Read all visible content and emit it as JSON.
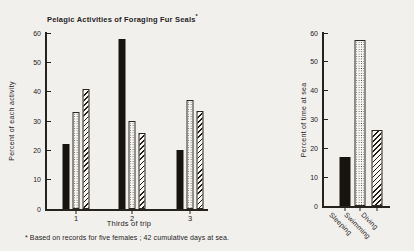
{
  "figure": {
    "title": "Pelagic Activities of Foraging Fur Seals",
    "title_mark": "*",
    "footnote": "* Based on records for five females ; 42 cumulative days at sea."
  },
  "colors": {
    "background": "#f2f0ec",
    "ink": "#26231f",
    "bar_solid": "#17140f",
    "pattern_bg": "#f8f7f4"
  },
  "chart_data": [
    {
      "type": "bar",
      "panel": "left",
      "title": "",
      "ylabel": "Percent of each activity",
      "xlabel": "Thirds of trip",
      "ylim": [
        0,
        60
      ],
      "yticks": [
        0,
        10,
        20,
        30,
        40,
        50,
        60
      ],
      "categories": [
        "1",
        "2",
        "3"
      ],
      "series": [
        {
          "name": "Sleeping",
          "pattern": "solid",
          "values": [
            22,
            58,
            20
          ]
        },
        {
          "name": "Swimming",
          "pattern": "stipple",
          "values": [
            33,
            30,
            37
          ]
        },
        {
          "name": "Diving",
          "pattern": "hatch",
          "values": [
            41,
            26,
            33.5
          ]
        }
      ],
      "grid": false,
      "legend": "none"
    },
    {
      "type": "bar",
      "panel": "right",
      "title": "",
      "ylabel": "Percent of time at sea",
      "xlabel": "",
      "ylim": [
        0,
        60
      ],
      "yticks": [
        0,
        10,
        20,
        30,
        40,
        50,
        60
      ],
      "categories": [
        "Sleeping",
        "Swimming",
        "Diving"
      ],
      "values": [
        17,
        57.5,
        26.5
      ],
      "patterns": [
        "solid",
        "stipple",
        "hatch"
      ],
      "xtick_rotation": 45,
      "grid": false,
      "legend": "none"
    }
  ]
}
